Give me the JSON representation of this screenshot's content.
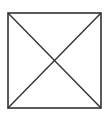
{
  "diagram": {
    "shape": "square-with-diagonals",
    "box": {
      "x1": 8,
      "y1": 13,
      "x2": 101,
      "y2": 108
    },
    "stroke_color": "#333333",
    "stroke_width": 1.6,
    "background_color": "#ffffff"
  }
}
